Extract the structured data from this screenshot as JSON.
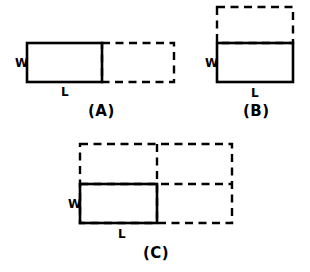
{
  "figure": {
    "background_color": "#ffffff",
    "stroke_color": "#000000"
  },
  "panels": [
    {
      "id": "A",
      "caption": "(A)",
      "width_label": "W",
      "length_label": "L",
      "description": "Original rectangle with one congruent dashed copy extended to the right (length doubled)",
      "solid_rect": {
        "x": 27,
        "y": 43,
        "w": 75,
        "h": 39
      },
      "dashed_rects": [
        {
          "x": 102,
          "y": 43,
          "w": 72,
          "h": 39
        }
      ],
      "dashed_lines": [],
      "width_label_pos": {
        "x": 15,
        "y": 67
      },
      "length_label_pos": {
        "x": 61,
        "y": 96
      },
      "caption_pos": {
        "x": 88,
        "y": 116
      }
    },
    {
      "id": "B",
      "caption": "(B)",
      "width_label": "W",
      "length_label": "L",
      "description": "Original rectangle with one congruent dashed copy stacked above (width doubled)",
      "solid_rect": {
        "x": 217,
        "y": 43,
        "w": 76,
        "h": 39
      },
      "dashed_rects": [
        {
          "x": 217,
          "y": 7,
          "w": 76,
          "h": 36
        }
      ],
      "dashed_lines": [],
      "width_label_pos": {
        "x": 205,
        "y": 67
      },
      "length_label_pos": {
        "x": 251,
        "y": 97
      },
      "caption_pos": {
        "x": 243,
        "y": 116
      }
    },
    {
      "id": "C",
      "caption": "(C)",
      "width_label": "W",
      "length_label": "L",
      "description": "Original rectangle with three congruent dashed copies forming a 2 by 2 array (length and width both doubled)",
      "solid_rect": {
        "x": 80,
        "y": 184,
        "w": 77,
        "h": 39
      },
      "dashed_rects": [
        {
          "x": 80,
          "y": 144,
          "w": 152,
          "h": 79
        }
      ],
      "dashed_lines": [
        {
          "x1": 157,
          "y1": 144,
          "x2": 157,
          "y2": 223
        },
        {
          "x1": 80,
          "y1": 184,
          "x2": 232,
          "y2": 184
        }
      ],
      "width_label_pos": {
        "x": 68,
        "y": 208
      },
      "length_label_pos": {
        "x": 118,
        "y": 238
      },
      "caption_pos": {
        "x": 143,
        "y": 258
      }
    }
  ]
}
